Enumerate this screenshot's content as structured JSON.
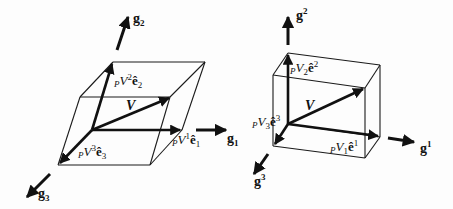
{
  "figure": {
    "left_panel": {
      "description": "Parallelepiped in covariant basis",
      "basis_labels": {
        "g1": "g",
        "g1_sub": "1",
        "g2": "g",
        "g2_sub": "2",
        "g3": "g",
        "g3_sub": "3"
      },
      "vector_label": "V",
      "components": [
        {
          "prefix": "P",
          "main": "V",
          "index": "1",
          "unit": "ê",
          "unit_index": "1"
        },
        {
          "prefix": "P",
          "main": "V",
          "index": "2",
          "unit": "ê",
          "unit_index": "2"
        },
        {
          "prefix": "P",
          "main": "V",
          "index": "3",
          "unit": "ê",
          "unit_index": "3"
        }
      ]
    },
    "right_panel": {
      "description": "Rectangular box in contravariant basis",
      "basis_labels": {
        "g1": "g",
        "g1_sup": "1",
        "g2": "g",
        "g2_sup": "2",
        "g3": "g",
        "g3_sup": "3"
      },
      "vector_label": "V",
      "components": [
        {
          "prefix": "P",
          "main": "V",
          "index": "1",
          "unit": "ê",
          "unit_index": "1"
        },
        {
          "prefix": "P",
          "main": "V",
          "index": "2",
          "unit": "ê",
          "unit_index": "2"
        },
        {
          "prefix": "P",
          "main": "V",
          "index": "3",
          "unit": "ê",
          "unit_index": "3"
        }
      ]
    },
    "colors": {
      "ink": "#111111",
      "background": "#fdfdfd"
    }
  }
}
